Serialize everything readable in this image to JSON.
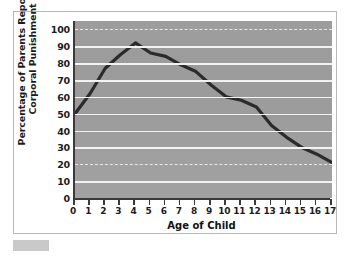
{
  "figure": {
    "background_color": "#ffffff",
    "frame_border_color": "#b9b9b9",
    "plot_background": "#9d9d9d",
    "line_color": "#2b2b2b",
    "gridline_color": "#f2f2f2",
    "axis_color": "#3a3a3a",
    "corner_swatch_color": "#c9c9c9"
  },
  "chart_data": {
    "type": "line",
    "title": "",
    "xlabel": "Age of Child",
    "ylabel": "Percentage of Parents Reporting Corporal Punishment",
    "ylabel_lines": [
      "Percentage of Parents Reporting",
      "Corporal Punishment"
    ],
    "x": [
      0,
      1,
      2,
      3,
      4,
      5,
      6,
      7,
      8,
      9,
      10,
      11,
      12,
      13,
      14,
      15,
      16,
      17
    ],
    "values": [
      50,
      62,
      77,
      85,
      92,
      86,
      84,
      79,
      75,
      67,
      60,
      58,
      54,
      43,
      36,
      30,
      26,
      21
    ],
    "xlim": [
      0,
      17
    ],
    "ylim": [
      0,
      105
    ],
    "xticks": [
      "0",
      "1",
      "2",
      "3",
      "4",
      "5",
      "6",
      "7",
      "8",
      "9",
      "10",
      "11",
      "12",
      "13",
      "14",
      "15",
      "16",
      "17"
    ],
    "yticks": [
      "0",
      "10",
      "20",
      "30",
      "40",
      "50",
      "60",
      "70",
      "80",
      "90",
      "100"
    ],
    "ytick_values": [
      0,
      10,
      20,
      30,
      40,
      50,
      60,
      70,
      80,
      90,
      100
    ],
    "dashed_gridlines": [
      20,
      100
    ],
    "grid": true,
    "legend": null,
    "series": [
      {
        "name": "Percentage of Parents Reporting Corporal Punishment",
        "values": [
          50,
          62,
          77,
          85,
          92,
          86,
          84,
          79,
          75,
          67,
          60,
          58,
          54,
          43,
          36,
          30,
          26,
          21
        ]
      }
    ]
  }
}
